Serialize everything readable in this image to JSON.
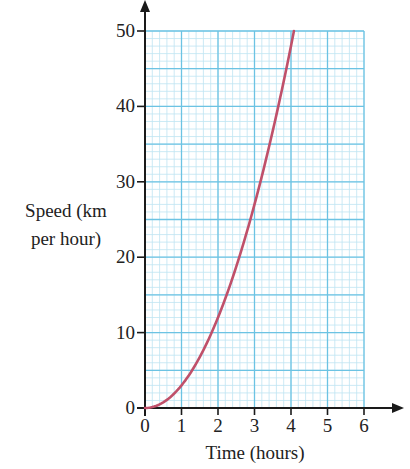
{
  "chart_data": {
    "type": "line",
    "title": "",
    "xlabel": "Time (hours)",
    "ylabel_lines": [
      "Speed (km",
      "per hour)"
    ],
    "ylabel": "Speed (km per hour)",
    "xlim": [
      0,
      6
    ],
    "ylim": [
      0,
      50
    ],
    "xticks": [
      0,
      1,
      2,
      3,
      4,
      5,
      6
    ],
    "yticks": [
      0,
      10,
      20,
      30,
      40,
      50
    ],
    "grid": {
      "on": true,
      "major_x": 1,
      "major_y": 5,
      "minor": 0.2
    },
    "series": [
      {
        "name": "speed",
        "color": "#c0506a",
        "x": [
          0,
          0.5,
          1,
          1.5,
          2,
          2.5,
          3,
          3.5,
          4,
          4.08
        ],
        "y": [
          0,
          0.75,
          3,
          6.75,
          12,
          18.75,
          27,
          36.75,
          48,
          50
        ]
      }
    ]
  },
  "colors": {
    "grid_minor": "#bfe4f2",
    "grid_major": "#6cc3e3",
    "axis": "#1a1a1a",
    "curve": "#c0506a"
  }
}
